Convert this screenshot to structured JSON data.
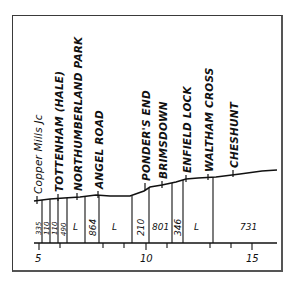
{
  "diagram": {
    "type": "railway-gradient-profile",
    "stations": [
      {
        "name": "Copper Mills Jc",
        "x": 34
      },
      {
        "name": "TOTTENHAM (HALE)",
        "x": 58
      },
      {
        "name": "NORTHUMBERLAND PARK",
        "x": 76
      },
      {
        "name": "ANGEL ROAD",
        "x": 96
      },
      {
        "name": "PONDER'S END",
        "x": 142
      },
      {
        "name": "BRIMSDOWN",
        "x": 162
      },
      {
        "name": "ENFIELD LOCK",
        "x": 186
      },
      {
        "name": "WALTHAM CROSS",
        "x": 208
      },
      {
        "name": "CHESHUNT",
        "x": 233
      }
    ],
    "gradients": [
      {
        "label": "335",
        "x": 38
      },
      {
        "label": "110",
        "x": 46
      },
      {
        "label": "110",
        "x": 54
      },
      {
        "label": "490",
        "x": 63
      },
      {
        "label": "L",
        "x": 78
      },
      {
        "label": "864",
        "x": 92
      },
      {
        "label": "L",
        "x": 117
      },
      {
        "label": "210",
        "x": 140
      },
      {
        "label": "801",
        "x": 160
      },
      {
        "label": "346",
        "x": 177
      },
      {
        "label": "L",
        "x": 197
      },
      {
        "label": "731",
        "x": 250
      }
    ],
    "axis": {
      "ticks": [
        "5",
        "10",
        "15"
      ],
      "unit": "miles"
    }
  }
}
